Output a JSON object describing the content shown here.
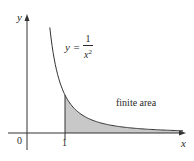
{
  "diagram": {
    "axes": {
      "x_label": "x",
      "y_label": "y",
      "origin_label": "0",
      "x_ticks": [
        {
          "value": 1,
          "label": "1"
        }
      ]
    },
    "curve": {
      "equation_lhs": "y =",
      "equation_numerator": "1",
      "equation_denominator_base": "x",
      "equation_denominator_exponent": "2",
      "function": "1/x^2"
    },
    "region": {
      "label": "finite area",
      "from_x": 1,
      "to_x": "infinity",
      "fill_color": "#c8c8c8"
    },
    "colors": {
      "line": "#333333",
      "fill": "#c8c8c8",
      "background": "#ffffff"
    }
  }
}
